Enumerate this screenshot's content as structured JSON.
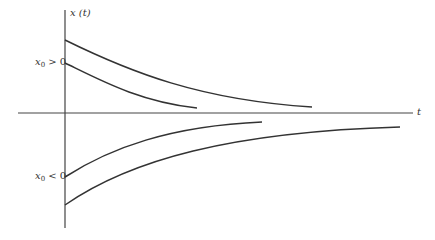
{
  "diagram": {
    "y_axis_label": "x (t)",
    "x_axis_label": "t",
    "labels": {
      "positive": {
        "var": "x",
        "sub": "0",
        "rel": " > 0"
      },
      "negative": {
        "var": "x",
        "sub": "0",
        "rel": " < 0"
      }
    },
    "colors": {
      "stroke": "#333333",
      "axis": "#444444",
      "background": "#ffffff"
    },
    "curves": [
      {
        "name": "upper-outer",
        "x0": 65,
        "y0": 40,
        "x1": 312,
        "y1": 107
      },
      {
        "name": "upper-inner",
        "x0": 65,
        "y0": 63,
        "x1": 197,
        "y1": 108
      },
      {
        "name": "lower-inner",
        "x0": 65,
        "y0": 177,
        "x1": 262,
        "y1": 122
      },
      {
        "name": "lower-outer",
        "x0": 65,
        "y0": 205,
        "x1": 400,
        "y1": 127
      }
    ]
  }
}
